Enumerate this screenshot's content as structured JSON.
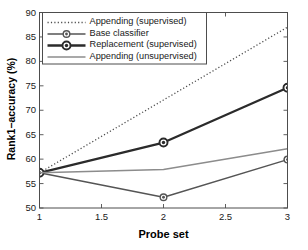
{
  "chart_data": {
    "type": "line",
    "title": "",
    "xlabel": "Probe set",
    "ylabel": "Rank1−accuracy (%)",
    "x": [
      1,
      2,
      3
    ],
    "xlim": [
      1,
      3
    ],
    "ylim": [
      50,
      90
    ],
    "xticks": [
      "1",
      "1.5",
      "2",
      "2.5",
      "3"
    ],
    "xtick_values": [
      1,
      1.5,
      2,
      2.5,
      3
    ],
    "yticks": [
      "50",
      "55",
      "60",
      "65",
      "70",
      "75",
      "80",
      "85",
      "90"
    ],
    "ytick_values": [
      50,
      55,
      60,
      65,
      70,
      75,
      80,
      85,
      90
    ],
    "grid": false,
    "legend_position": "upper left",
    "series": [
      {
        "name": "Appending (supervised)",
        "values": [
          57.2,
          72.1,
          87.0
        ],
        "style": "dotted",
        "marker": "none",
        "color": "#4d4d4d"
      },
      {
        "name": "Base classifier",
        "values": [
          57.2,
          52.2,
          59.9
        ],
        "style": "solid",
        "marker": "circle-dot",
        "color": "#555555"
      },
      {
        "name": "Replacement (supervised)",
        "values": [
          57.2,
          63.4,
          74.6
        ],
        "style": "solid-thick",
        "marker": "circle-dot",
        "color": "#2b2b2b"
      },
      {
        "name": "Appending (unsupervised)",
        "values": [
          57.2,
          57.9,
          62.1
        ],
        "style": "solid",
        "marker": "none",
        "color": "#8c8c8c"
      }
    ]
  },
  "axes": {
    "frame_color": "#4d4d4d",
    "background": "#ffffff"
  },
  "legend": {
    "border_color": "#4d4d4d",
    "background": "#ffffff",
    "entries": [
      {
        "label": "Appending (supervised)"
      },
      {
        "label": "Base classifier"
      },
      {
        "label": "Replacement (supervised)"
      },
      {
        "label": "Appending (unsupervised)"
      }
    ]
  }
}
